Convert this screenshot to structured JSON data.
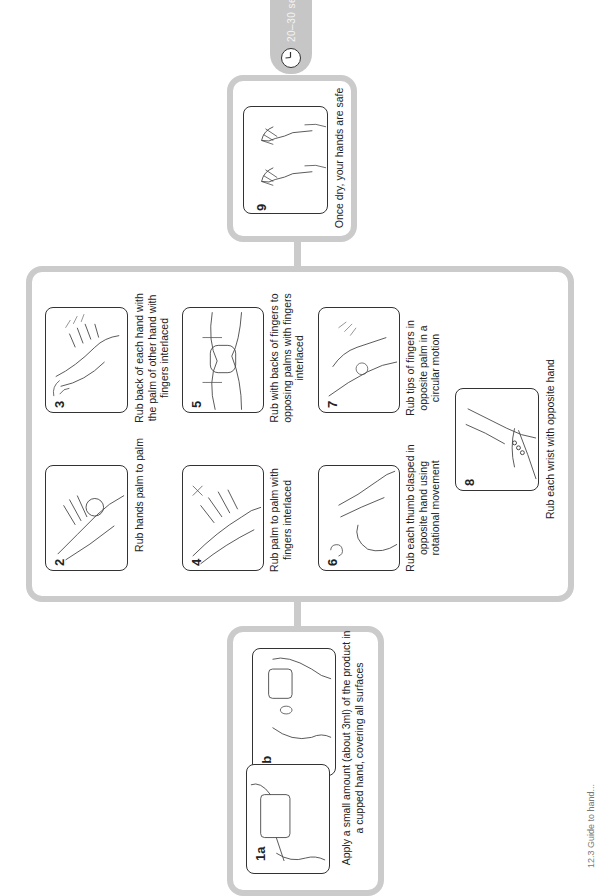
{
  "timer": {
    "label": "20–30 se",
    "icon": "clock-icon"
  },
  "steps": {
    "s9": {
      "number": "9",
      "text": "Once dry, your hands are safe"
    },
    "s2": {
      "number": "2",
      "text": "Rub hands palm to palm"
    },
    "s3": {
      "number": "3",
      "text": "Rub back of each hand with the palm of other hand with fingers interlaced"
    },
    "s4": {
      "number": "4",
      "text": "Rub palm to palm with fingers interlaced"
    },
    "s5": {
      "number": "5",
      "text": "Rub with backs of fingers to opposing palms with fingers interlaced"
    },
    "s6": {
      "number": "6",
      "text": "Rub each thumb clasped in opposite hand using rotational movement"
    },
    "s7": {
      "number": "7",
      "text": "Rub tips of fingers in opposite palm in a circular motion"
    },
    "s8": {
      "number": "8",
      "text": "Rub each wrist with opposite hand"
    },
    "s1a": {
      "number": "1a"
    },
    "s1b": {
      "number": "1b"
    },
    "s1": {
      "text": "Apply a small amount (about 3ml) of the product in a cupped hand, covering all surfaces"
    }
  },
  "caption": {
    "text": "12.3 Guide to hand..."
  },
  "colors": {
    "frame": "#cbcbcb",
    "pill": "#c6c6c6",
    "outline": "#333333",
    "background": "#ffffff"
  }
}
